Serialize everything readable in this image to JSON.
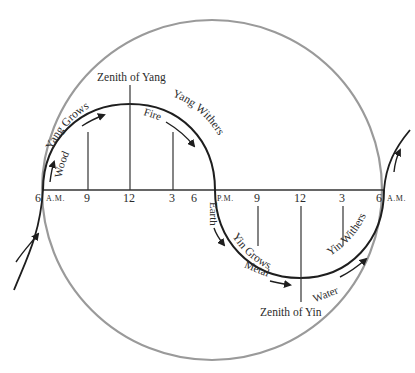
{
  "colors": {
    "outer_circle": "#9a9a9a",
    "curve": "#1e1e1e",
    "line": "#333333",
    "text": "#2b2b2b",
    "background": "#ffffff"
  },
  "axis": {
    "left_hour": "6",
    "left_suffix": "A.M.",
    "right_hour": "6",
    "right_suffix": "A.M.",
    "mid_hour": "6",
    "mid_suffix": "P.M.",
    "yang_ticks": [
      "9",
      "12",
      "3"
    ],
    "yin_ticks": [
      "9",
      "12",
      "3"
    ]
  },
  "yang": {
    "zenith_label": "Zenith of Yang",
    "grows_label": "Yang Grows",
    "withers_label": "Yang Withers",
    "element_rising": "Wood",
    "element_falling": "Fire"
  },
  "transition": {
    "label": "Earth"
  },
  "yin": {
    "zenith_label": "Zenith of Yin",
    "grows_label": "Yin Grows",
    "withers_label": "Yin Withers",
    "element_rising": "Metal",
    "element_falling": "Water"
  }
}
